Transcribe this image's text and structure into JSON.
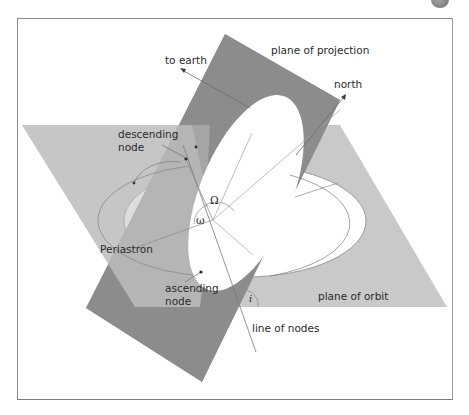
{
  "figure": {
    "labels": {
      "plane_of_projection": "plane of projection",
      "to_earth": "to earth",
      "north": "north",
      "descending_node": "descending node",
      "descending_line1": "descending",
      "descending_line2": "node",
      "periastron": "Periastron",
      "ascending_line1": "ascending",
      "ascending_line2": "node",
      "plane_of_orbit": "plane of orbit",
      "line_of_nodes": "line of nodes",
      "omega_upper": "Ω",
      "omega_lower": "ω",
      "inclination": "i"
    },
    "colors": {
      "projection_plane": "#8c8c8c",
      "orbit_plane": "#c9c9c9",
      "overlap": "#a6a6a6",
      "line": "#9a9a9a",
      "text": "#2a2a2a",
      "background": "#ffffff"
    }
  }
}
